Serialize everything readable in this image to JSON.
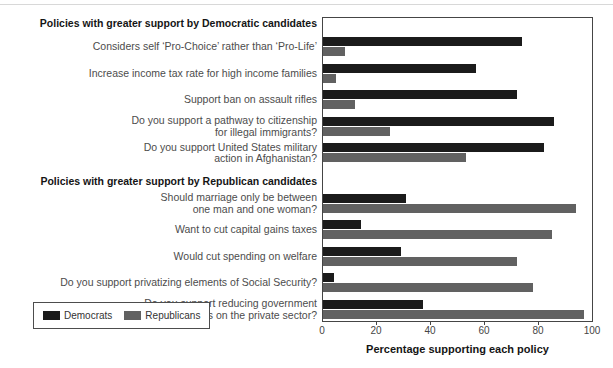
{
  "chart_data": {
    "type": "bar",
    "orientation": "horizontal",
    "xlabel": "Percentage supporting each policy",
    "xlim": [
      0,
      100
    ],
    "x_ticks": [
      0,
      20,
      40,
      60,
      80,
      100
    ],
    "grid": false,
    "legend": {
      "position": "bottom-left",
      "entries": [
        {
          "label": "Democrats",
          "color": "#1b1b1b"
        },
        {
          "label": "Republicans",
          "color": "#616161"
        }
      ]
    },
    "series_names": [
      "Democrats",
      "Republicans"
    ],
    "sections": [
      {
        "header": "Policies with greater support by Democratic candidates",
        "items": [
          {
            "label": "Considers self ‘Pro-Choice’ rather than ‘Pro-Life’",
            "democrats": 74,
            "republicans": 8
          },
          {
            "label": "Increase income tax rate for high income families",
            "democrats": 57,
            "republicans": 5
          },
          {
            "label": "Support ban on assault rifles",
            "democrats": 72,
            "republicans": 12
          },
          {
            "label": "Do you support a pathway to citizenship\nfor illegal immigrants?",
            "democrats": 86,
            "republicans": 25
          },
          {
            "label": "Do you support United States military\naction in Afghanistan?",
            "democrats": 82,
            "republicans": 53
          }
        ]
      },
      {
        "header": "Policies with greater support by Republican candidates",
        "items": [
          {
            "label": "Should marriage only be between\none man and one woman?",
            "democrats": 31,
            "republicans": 94
          },
          {
            "label": "Want to cut capital gains taxes",
            "democrats": 14,
            "republicans": 85
          },
          {
            "label": "Would cut spending on welfare",
            "democrats": 29,
            "republicans": 72
          },
          {
            "label": "Do you support privatizing elements of Social Security?",
            "democrats": 4,
            "republicans": 78
          },
          {
            "label": "Do you support reducing government\nregulations on the private sector?",
            "democrats": 37,
            "republicans": 97
          }
        ]
      }
    ]
  }
}
